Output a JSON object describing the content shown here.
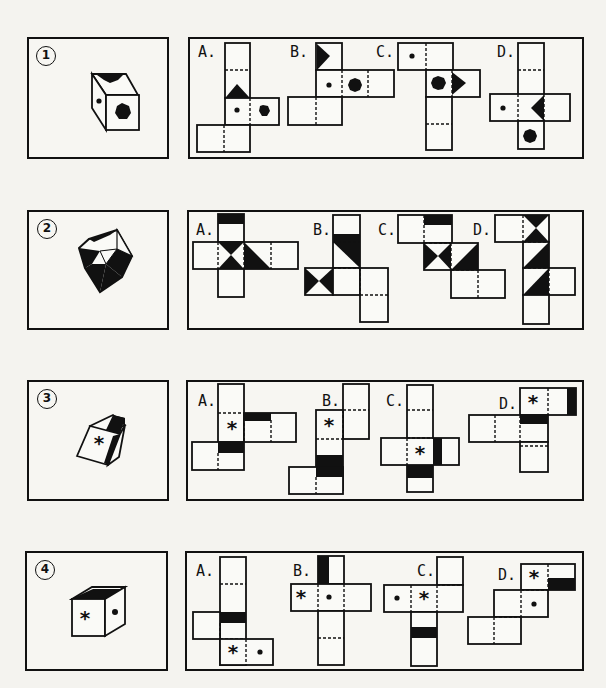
{
  "puzzles": [
    {
      "number": "1",
      "cube_description": "Cube with black notch on top, dot on left face, black hexagon on front face",
      "options": [
        {
          "label": "A.",
          "description": "Net with triangle, dot and hexagon faces"
        },
        {
          "label": "B.",
          "description": "Net with triangle top-left, dot and hexagon faces"
        },
        {
          "label": "C.",
          "description": "Net with dot top-left, hexagon and triangle faces"
        },
        {
          "label": "D.",
          "description": "Net with dot left, triangle center, hexagon bottom"
        }
      ]
    },
    {
      "number": "2",
      "cube_description": "Cube with black and white triangular patterns on faces",
      "options": [
        {
          "label": "A.",
          "description": "Cross net with black bar top and hourglass faces"
        },
        {
          "label": "B.",
          "description": "Net with black bar, diagonal and hourglass faces"
        },
        {
          "label": "C.",
          "description": "Stair net with black bar, hourglass and diagonal faces"
        },
        {
          "label": "D.",
          "description": "Column net with hourglass and diagonal faces"
        }
      ]
    },
    {
      "number": "3",
      "cube_description": "Tilted cube with asterisk on front face and black bands on top and right edges",
      "options": [
        {
          "label": "A.",
          "description": "Net with asterisk and two black bands"
        },
        {
          "label": "B.",
          "description": "Net with asterisk and black band lower"
        },
        {
          "label": "C.",
          "description": "Cross net with asterisk and black bands"
        },
        {
          "label": "D.",
          "description": "Net with asterisk top and black bands"
        }
      ]
    },
    {
      "number": "4",
      "cube_description": "Cube with asterisk on front face, dot on right face, black band along top edge",
      "options": [
        {
          "label": "A.",
          "description": "Column net with black band and asterisk/dot faces"
        },
        {
          "label": "B.",
          "description": "Cross net with black band top and asterisk/dot faces"
        },
        {
          "label": "C.",
          "description": "Net with dot, asterisk and black band below"
        },
        {
          "label": "D.",
          "description": "Stair net with asterisk, black band and dot"
        }
      ]
    }
  ],
  "symbols": {
    "asterisk": "*"
  }
}
